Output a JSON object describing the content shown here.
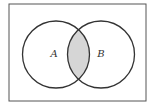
{
  "diagram": {
    "type": "venn",
    "universe": {
      "x": 9,
      "y": 4,
      "width": 137,
      "height": 97,
      "stroke": "#555555"
    },
    "sets": [
      {
        "label": "A",
        "cx": 56,
        "cy": 54.5,
        "r": 33.5,
        "label_x": 54,
        "label_y": 57
      },
      {
        "label": "B",
        "cx": 101,
        "cy": 54.5,
        "r": 33.5,
        "label_x": 101,
        "label_y": 57
      }
    ],
    "shaded_region": "A ∩ B",
    "colors": {
      "stroke": "#333333",
      "shade": "#d6d6d6",
      "background": "#ffffff"
    }
  }
}
